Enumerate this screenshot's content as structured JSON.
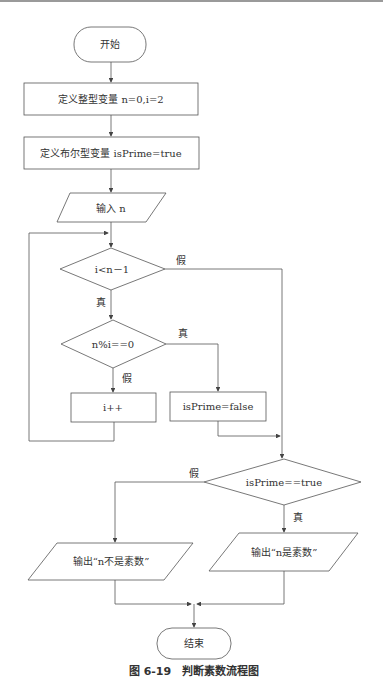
{
  "diagram": {
    "type": "flowchart",
    "caption": "图 6-19　判断素数流程图",
    "nodes": {
      "start": "开始",
      "init_int": "定义整型变量 n=0,i=2",
      "init_bool": "定义布尔型变量 isPrime=true",
      "input": "输入 n",
      "cond_loop": "i<n－1",
      "cond_mod": "n%i==0",
      "incr": "i++",
      "set_false": "isPrime=false",
      "cond_prime": "isPrime==true",
      "out_not_prime": "输出“n不是素数”",
      "out_prime": "输出“n是素数”",
      "end": "结束"
    },
    "edge_labels": {
      "loop_false": "假",
      "loop_true": "真",
      "mod_true": "真",
      "mod_false": "假",
      "prime_false": "假",
      "prime_true": "真"
    },
    "edges": [
      [
        "start",
        "init_int"
      ],
      [
        "init_int",
        "init_bool"
      ],
      [
        "init_bool",
        "input"
      ],
      [
        "input",
        "cond_loop"
      ],
      [
        "cond_loop",
        "cond_mod",
        "真"
      ],
      [
        "cond_loop",
        "cond_prime",
        "假"
      ],
      [
        "cond_mod",
        "set_false",
        "真"
      ],
      [
        "cond_mod",
        "incr",
        "假"
      ],
      [
        "incr",
        "cond_loop"
      ],
      [
        "set_false",
        "cond_prime"
      ],
      [
        "cond_prime",
        "out_prime",
        "真"
      ],
      [
        "cond_prime",
        "out_not_prime",
        "假"
      ],
      [
        "out_prime",
        "end"
      ],
      [
        "out_not_prime",
        "end"
      ]
    ]
  }
}
